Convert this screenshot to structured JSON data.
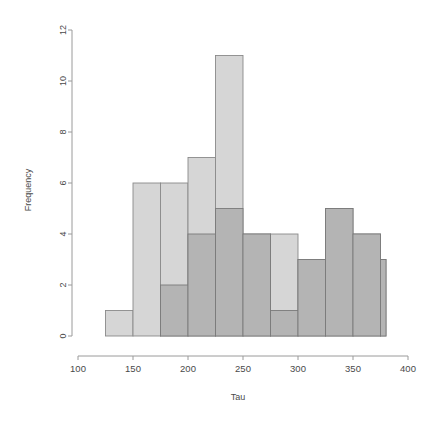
{
  "figure": {
    "title": "",
    "ghost_header": "",
    "background": "#ffffff"
  },
  "chart_data": {
    "type": "bar",
    "subtype": "overlapping-histogram",
    "title": "",
    "xlabel": "Tau",
    "ylabel": "Frequency",
    "xlim": [
      100,
      400
    ],
    "ylim": [
      0,
      12
    ],
    "xticks": [
      100,
      150,
      200,
      250,
      300,
      350,
      400
    ],
    "xtick_labels": [
      "100",
      "150",
      "200",
      "250",
      "300",
      "350",
      "400"
    ],
    "yticks": [
      0,
      2,
      4,
      6,
      8,
      10,
      12
    ],
    "ytick_labels": [
      "0",
      "2",
      "4",
      "6",
      "8",
      "10",
      "12"
    ],
    "grid": false,
    "legend": false,
    "bin_width": 25,
    "bin_edges": [
      125,
      150,
      175,
      200,
      225,
      250,
      275,
      300,
      325,
      350,
      375,
      380
    ],
    "series": [
      {
        "name": "Series A",
        "color": "#d6d6d6",
        "edge_color": "#8a8a8a",
        "bins": [
          {
            "x0": 125,
            "x1": 150,
            "value": 1
          },
          {
            "x0": 150,
            "x1": 175,
            "value": 6
          },
          {
            "x0": 175,
            "x1": 200,
            "value": 6
          },
          {
            "x0": 200,
            "x1": 225,
            "value": 7
          },
          {
            "x0": 225,
            "x1": 250,
            "value": 11
          },
          {
            "x0": 250,
            "x1": 275,
            "value": 4
          },
          {
            "x0": 275,
            "x1": 300,
            "value": 4
          },
          {
            "x0": 300,
            "x1": 325,
            "value": 3
          },
          {
            "x0": 325,
            "x1": 350,
            "value": 5
          },
          {
            "x0": 350,
            "x1": 375,
            "value": 4
          },
          {
            "x0": 375,
            "x1": 380,
            "value": 3
          }
        ]
      },
      {
        "name": "Series B",
        "color": "#b4b4b4",
        "edge_color": "#7a7a7a",
        "bins": [
          {
            "x0": 150,
            "x1": 175,
            "value": 0
          },
          {
            "x0": 175,
            "x1": 200,
            "value": 2
          },
          {
            "x0": 200,
            "x1": 225,
            "value": 4
          },
          {
            "x0": 225,
            "x1": 250,
            "value": 5
          },
          {
            "x0": 250,
            "x1": 275,
            "value": 4
          },
          {
            "x0": 275,
            "x1": 300,
            "value": 1
          },
          {
            "x0": 300,
            "x1": 325,
            "value": 3
          },
          {
            "x0": 325,
            "x1": 350,
            "value": 5
          },
          {
            "x0": 350,
            "x1": 375,
            "value": 4
          },
          {
            "x0": 375,
            "x1": 380,
            "value": 3
          }
        ]
      }
    ]
  },
  "axes": {
    "y_axis_label": "Frequency",
    "x_axis_label": "Tau"
  },
  "colors": {
    "light_bar": "#d6d6d6",
    "dark_bar": "#b4b4b4",
    "bar_edge": "#8a8a8a",
    "axis": "#9a9a9a",
    "text": "#4a4a4a"
  }
}
